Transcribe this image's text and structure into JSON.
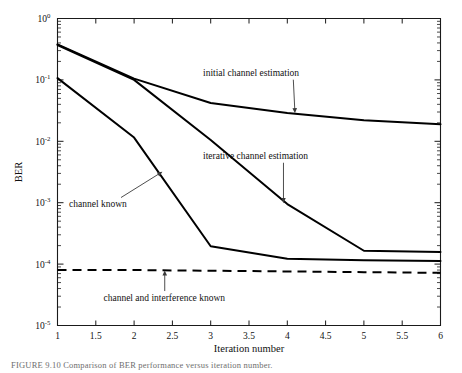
{
  "figure": {
    "caption": "FIGURE 9.10    Comparison of BER performance versus iteration number."
  },
  "chart_data": {
    "type": "line",
    "title": "",
    "xlabel": "Iteration number",
    "ylabel": "BER",
    "xlim": [
      1,
      6
    ],
    "ylim": [
      1e-05,
      1
    ],
    "yscale": "log",
    "xscale": "linear",
    "grid": false,
    "legend": "annotations",
    "xticks": [
      1,
      1.5,
      2,
      2.5,
      3,
      3.5,
      4,
      4.5,
      5,
      5.5,
      6
    ],
    "xtick_labels": [
      "1",
      "1.5",
      "2",
      "2.5",
      "3",
      "3.5",
      "4",
      "4.5",
      "5",
      "5.5",
      "6"
    ],
    "yticks": [
      1e-05,
      0.0001,
      0.001,
      0.01,
      0.1,
      1
    ],
    "ytick_labels": [
      "10-5",
      "10-4",
      "10-3",
      "10-2",
      "10-1",
      "100"
    ],
    "ytick_mantissa": [
      "10",
      "10",
      "10",
      "10",
      "10",
      "10"
    ],
    "ytick_exponents": [
      "-5",
      "-4",
      "-3",
      "-2",
      "-1",
      "0"
    ],
    "x": [
      1,
      2,
      3,
      4,
      5,
      6
    ],
    "series": [
      {
        "name": "initial channel estimation",
        "style": "solid",
        "values": [
          0.38,
          0.105,
          0.042,
          0.029,
          0.022,
          0.019
        ]
      },
      {
        "name": "iterative channel estimation",
        "style": "solid",
        "values": [
          0.37,
          0.1,
          0.0105,
          0.00095,
          0.000165,
          0.000158
        ]
      },
      {
        "name": "channel known",
        "style": "solid",
        "values": [
          0.107,
          0.0115,
          0.000195,
          0.000122,
          0.000115,
          0.000112
        ]
      },
      {
        "name": "channel and interference known",
        "style": "dashed",
        "values": [
          8e-05,
          8e-05,
          7.8e-05,
          7.6e-05,
          7.4e-05,
          7.2e-05
        ]
      }
    ],
    "annotations": [
      {
        "name": "initial channel estimation",
        "text": "initial channel estimation",
        "text_x": 2.9,
        "text_y": 0.115,
        "point_x": 4.1,
        "point_y": 0.0285
      },
      {
        "name": "iterative channel estimation",
        "text": "iterative channel estimation",
        "text_x": 2.9,
        "text_y": 0.0051,
        "point_x": 3.95,
        "point_y": 0.00098
      },
      {
        "name": "channel known",
        "text": "channel known",
        "text_x": 1.15,
        "text_y": 0.00085,
        "point_x": 2.37,
        "point_y": 0.0032
      },
      {
        "name": "channel and interference known",
        "text": "channel and interference known",
        "text_x": 1.6,
        "text_y": 2.55e-05,
        "point_x": 2.4,
        "point_y": 7.9e-05
      }
    ]
  }
}
